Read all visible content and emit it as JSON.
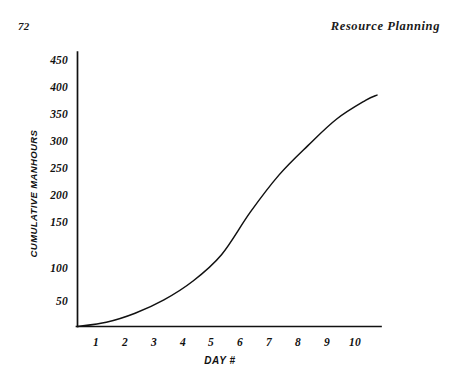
{
  "page": {
    "folio": "72",
    "running_title": "Resource Planning",
    "background_color": "#ffffff",
    "ink_color": "#111111"
  },
  "chart_data": {
    "type": "line",
    "title": "",
    "subtitle": "",
    "xlabel": "DAY #",
    "ylabel": "CUMULATIVE MANHOURS",
    "x": [
      0,
      1,
      2,
      3,
      4,
      5,
      6,
      7,
      8,
      9,
      10,
      10.4
    ],
    "values": [
      0,
      8,
      25,
      50,
      85,
      135,
      215,
      285,
      340,
      390,
      425,
      435
    ],
    "series": [
      {
        "name": "Cumulative manhours",
        "values": [
          0,
          8,
          25,
          50,
          85,
          135,
          215,
          285,
          340,
          390,
          425,
          435
        ]
      }
    ],
    "xtick_labels": [
      "1",
      "2",
      "3",
      "4",
      "5",
      "6",
      "7",
      "8",
      "9",
      "10"
    ],
    "xtick_values": [
      1,
      2,
      3,
      4,
      5,
      6,
      7,
      8,
      9,
      10
    ],
    "ytick_labels": [
      "50",
      "100",
      "150",
      "200",
      "250",
      "300",
      "350",
      "400",
      "450"
    ],
    "ytick_values": [
      50,
      100,
      150,
      200,
      250,
      300,
      350,
      400,
      450
    ],
    "xlim": [
      0,
      10.75
    ],
    "ylim": [
      0,
      470
    ],
    "grid": false,
    "legend": "none",
    "line_color": "#111111",
    "curve_shape": "s-curve"
  }
}
